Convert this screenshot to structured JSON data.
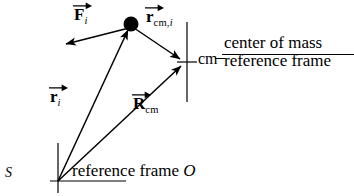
{
  "diagram": {
    "background_color": "#ffffff",
    "stroke_color": "#000000",
    "labels": {
      "force_symbol": "F",
      "force_subscript": "i",
      "r_cm_i_symbol": "r",
      "r_cm_i_subscript": "cm,",
      "r_cm_i_subscript_italic": "i",
      "r_i_symbol": "r",
      "r_i_subscript": "i",
      "R_cm_symbol": "R",
      "R_cm_subscript": "cm",
      "cm_marker": "cm",
      "origin": "S",
      "reference_frame_text": "reference frame ",
      "reference_frame_letter": "O",
      "cm_frame_line1": "center of mass",
      "cm_frame_line2": "reference frame"
    },
    "geometry": {
      "origin_S": [
        58,
        181
      ],
      "particle": [
        131,
        24
      ],
      "cm_point": [
        186,
        62
      ],
      "force_tip": [
        62,
        45
      ],
      "axis_vertical": [
        58,
        143,
        58,
        193
      ],
      "axis_horizontal": [
        50,
        181,
        126,
        181
      ],
      "cm_vertical_line": [
        187,
        22,
        187,
        102
      ],
      "cm_cross_tick": [
        178,
        62,
        196,
        62
      ]
    }
  }
}
